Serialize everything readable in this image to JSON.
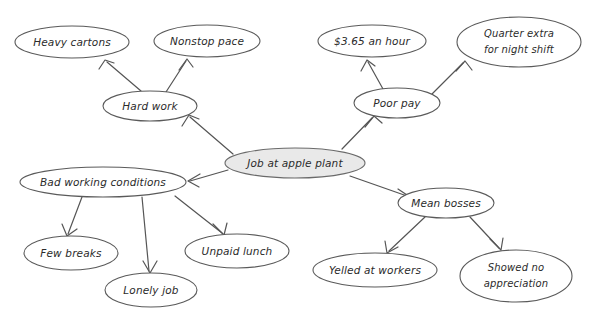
{
  "diagram": {
    "type": "concept-map",
    "center_node": {
      "id": "center",
      "label": "Job at apple plant",
      "fill_color": "#e9e9e9",
      "stroke_color": "#6a6a6a",
      "cx": 295,
      "cy": 163,
      "rx": 70,
      "ry": 15
    },
    "branch_nodes": [
      {
        "id": "hard-work",
        "label": "Hard work",
        "cx": 150,
        "cy": 106,
        "rx": 47,
        "ry": 15
      },
      {
        "id": "poor-pay",
        "label": "Poor pay",
        "cx": 397,
        "cy": 103,
        "rx": 43,
        "ry": 15
      },
      {
        "id": "bad-working-conditions",
        "label": "Bad working conditions",
        "cx": 103,
        "cy": 182,
        "rx": 83,
        "ry": 15
      },
      {
        "id": "mean-bosses",
        "label": "Mean bosses",
        "cx": 446,
        "cy": 203,
        "rx": 48,
        "ry": 15
      }
    ],
    "leaf_nodes": [
      {
        "id": "heavy-cartons",
        "label": "Heavy cartons",
        "cx": 72,
        "cy": 42,
        "rx": 57,
        "ry": 16
      },
      {
        "id": "nonstop-pace",
        "label": "Nonstop pace",
        "cx": 207,
        "cy": 41,
        "rx": 53,
        "ry": 16
      },
      {
        "id": "dollar-rate",
        "label": "$3.65 an hour",
        "cx": 372,
        "cy": 41,
        "rx": 54,
        "ry": 16
      },
      {
        "id": "quarter-extra",
        "label_line1": "Quarter extra",
        "label_line2": "for night shift",
        "cx": 519,
        "cy": 42,
        "rx": 62,
        "ry": 25
      },
      {
        "id": "few-breaks",
        "label": "Few breaks",
        "cx": 71,
        "cy": 253,
        "rx": 47,
        "ry": 17
      },
      {
        "id": "lonely-job",
        "label": "Lonely job",
        "cx": 151,
        "cy": 290,
        "rx": 46,
        "ry": 17
      },
      {
        "id": "unpaid-lunch",
        "label": "Unpaid lunch",
        "cx": 237,
        "cy": 251,
        "rx": 52,
        "ry": 17
      },
      {
        "id": "yelled-at-workers",
        "label": "Yelled at workers",
        "cx": 375,
        "cy": 270,
        "rx": 62,
        "ry": 17
      },
      {
        "id": "showed-no-appreciation",
        "label_line1": "Showed no",
        "label_line2": "appreciation",
        "cx": 516,
        "cy": 276,
        "rx": 56,
        "ry": 26
      }
    ],
    "edges": [
      {
        "from": "center",
        "to": "hard-work",
        "path": "M 233 154 L 190 117"
      },
      {
        "from": "center",
        "to": "poor-pay",
        "path": "M 342 149 L 372 118"
      },
      {
        "from": "center",
        "to": "bad-working-conditions",
        "path": "M 228 170 L 190 181"
      },
      {
        "from": "center",
        "to": "mean-bosses",
        "path": "M 350 176 L 407 196"
      },
      {
        "from": "hard-work",
        "to": "heavy-cartons",
        "path": "M 141 91 L 107 62"
      },
      {
        "from": "hard-work",
        "to": "nonstop-pace",
        "path": "M 166 92 L 186 61"
      },
      {
        "from": "poor-pay",
        "to": "dollar-rate",
        "path": "M 383 89 L 368 62"
      },
      {
        "from": "poor-pay",
        "to": "quarter-extra",
        "path": "M 432 94 L 463 63"
      },
      {
        "from": "bad-working-conditions",
        "to": "few-breaks",
        "path": "M 82 197 L 68 234"
      },
      {
        "from": "bad-working-conditions",
        "to": "lonely-job",
        "path": "M 142 197 L 149 271"
      },
      {
        "from": "bad-working-conditions",
        "to": "unpaid-lunch",
        "path": "M 175 196 L 222 233"
      },
      {
        "from": "mean-bosses",
        "to": "yelled-at-workers",
        "path": "M 425 217 L 389 251"
      },
      {
        "from": "mean-bosses",
        "to": "showed-no-appreciation",
        "path": "M 470 217 L 499 248"
      },
      {
        "from": "hard-work-to-heavy-cartons-head",
        "to": "",
        "path": "M 99 69 L 105 60 L 114 63"
      },
      {
        "from": "hard-work-to-nonstop-pace-head",
        "to": "",
        "path": "M 179 70 L 187 59 L 193 67"
      },
      {
        "from": "poor-pay-to-dollar-head",
        "to": "",
        "path": "M 361 71 L 367 60 L 375 66"
      },
      {
        "from": "poor-pay-to-quarter-head",
        "to": "",
        "path": "M 456 71 L 465 61 L 472 70"
      },
      {
        "from": "center-to-hard-work-head",
        "to": "",
        "path": "M 182 126 L 189 115 L 199 119"
      },
      {
        "from": "center-to-poor-pay-head",
        "to": "",
        "path": "M 365 127 L 374 116 L 382 123"
      },
      {
        "from": "center-to-bad-head",
        "to": "",
        "path": "M 200 174 L 188 181 L 199 187"
      },
      {
        "from": "center-to-mean-head",
        "to": "",
        "path": "M 398 189 L 410 197 L 399 203"
      },
      {
        "from": "bad-to-few-head",
        "to": "",
        "path": "M 62 224 L 67 236 L 77 229"
      },
      {
        "from": "bad-to-lonely-head",
        "to": "",
        "path": "M 143 261 L 150 273 L 157 261"
      },
      {
        "from": "bad-to-unpaid-head",
        "to": "",
        "path": "M 213 224 L 224 235 L 227 223"
      },
      {
        "from": "mean-to-yelled-head",
        "to": "",
        "path": "M 385 241 L 387 253 L 398 247"
      },
      {
        "from": "mean-to-showed-head",
        "to": "",
        "path": "M 490 239 L 501 250 L 503 238"
      }
    ]
  }
}
